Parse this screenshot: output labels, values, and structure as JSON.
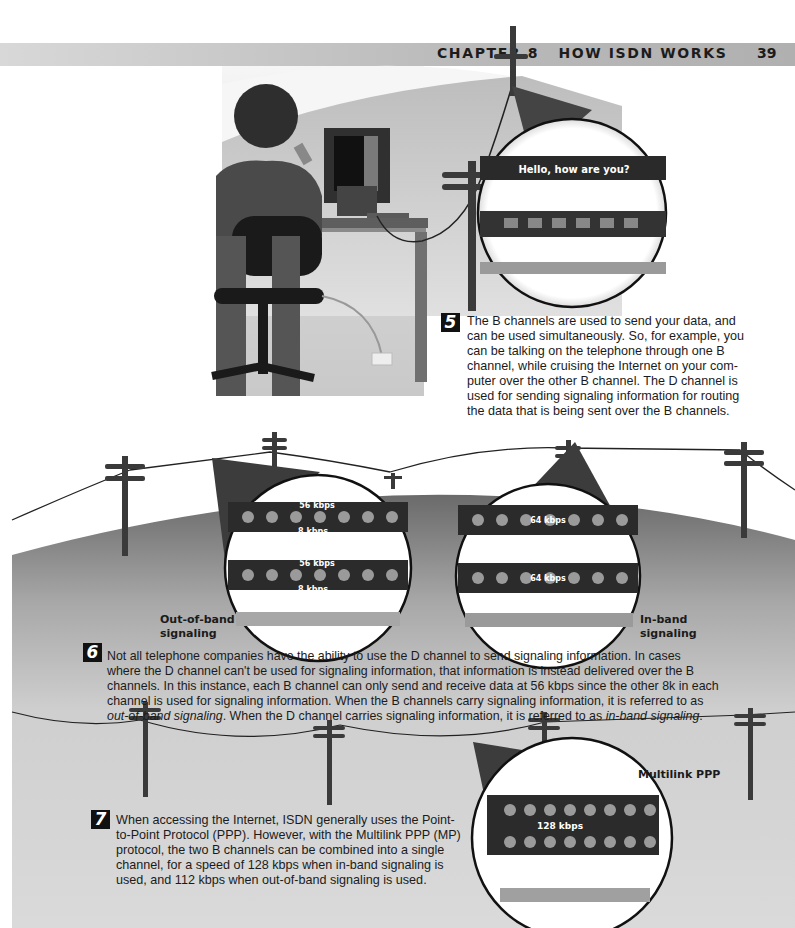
{
  "header": {
    "chapter": "CHAPTER 8   HOW ISDN WORKS",
    "page_number": "39"
  },
  "steps": [
    {
      "number": "5",
      "text": "The B channels are used to send your data, and can be used simultaneously. So, for example, you can be talking on the telephone through one B channel, while cruising the Internet on your computer over the other B channel. The D channel is used for sending signaling information for routing the data that is being sent over the B channels.",
      "lines": [
        "The B channels are used to send your data, and",
        "can be used simultaneously. So, for example, you",
        "can be talking on the telephone through one B",
        "channel, while cruising the Internet on your com-",
        "puter over the other B channel. The D channel is",
        "used for sending signaling information for routing",
        "the data that is being sent over the B channels."
      ]
    },
    {
      "number": "6",
      "lines": [
        "Not all telephone companies have the ability to use the D channel to send signaling information. In cases",
        "where the D channel can't be used for signaling information, that information is instead delivered over the B",
        "channels. In this instance, each B channel can only send and receive data at 56 kbps since the other 8k in each",
        "channel is used for signaling information. When the B channels carry signaling information, it is referred to as"
      ],
      "last_line": {
        "italic1": "out-of-band signaling",
        "middle": ". When the D channel carries signaling information, it is referred to as ",
        "italic2": "in-band signaling",
        "end": "."
      }
    },
    {
      "number": "7",
      "lines": [
        "When accessing the Internet, ISDN generally uses the Point-",
        "to-Point Protocol (PPP). However, with the Multilink PPP (MP)",
        "protocol, the two B channels can be combined into a single",
        "channel, for a speed of 128 kbps when in-band signaling is",
        "used, and 112 kbps when out-of-band signaling is used."
      ]
    }
  ],
  "illustrations": {
    "magnifier1": {
      "caption": "Hello, how are you?"
    },
    "magnifier_out_of_band": {
      "label_line1": "Out-of-band",
      "label_line2": "signaling",
      "rate_top": "56 kbps",
      "rate_bottom": "8 kbps"
    },
    "magnifier_in_band": {
      "label_line1": "In-band",
      "label_line2": "signaling",
      "rate": "64 kbps"
    },
    "magnifier_multilink": {
      "label": "Multilink PPP",
      "rate": "128 kbps"
    }
  },
  "colors": {
    "header_bar": "#b9b9b9",
    "badge": "#111111",
    "pole": "#3a3a3a",
    "hill_top": "#6f6f6f",
    "hill_bottom": "#d6d6d6"
  }
}
